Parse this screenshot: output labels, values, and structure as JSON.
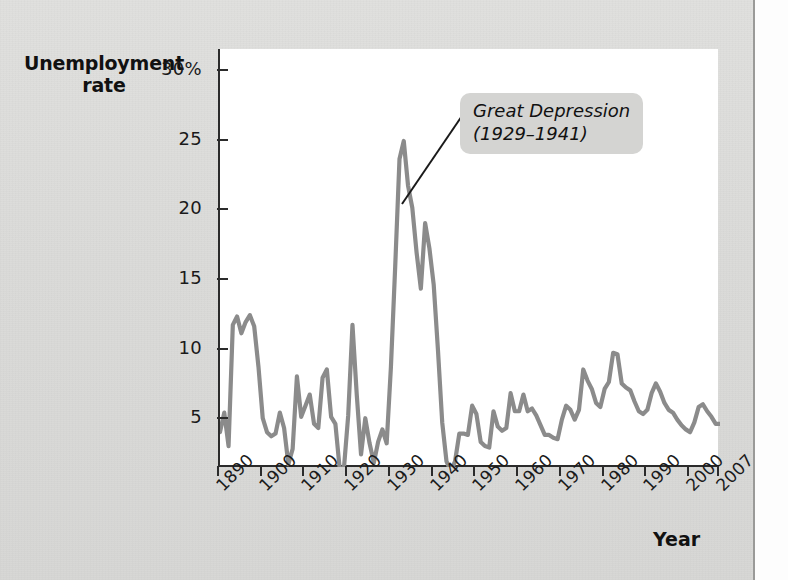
{
  "figure": {
    "y_axis_title": "Unemployment\nrate",
    "x_axis_title": "Year",
    "annotation": {
      "line1": "Great Depression",
      "line2": "(1929–1941)"
    }
  },
  "colors": {
    "background": "#dcdcda",
    "plot_background": "#ffffff",
    "axis": "#2b2b2b",
    "line": "#8b8b8b",
    "annotation_box": "#d4d4d2",
    "text": "#111111"
  },
  "chart_data": {
    "type": "line",
    "title": "",
    "subtitle": "",
    "xlabel": "Year",
    "ylabel": "Unemployment rate",
    "xlim": [
      1890,
      2007
    ],
    "ylim": [
      1.5,
      31.5
    ],
    "grid": false,
    "legend": null,
    "ytick_labels": [
      "30%",
      "25",
      "20",
      "15",
      "10",
      "5"
    ],
    "ytick_values": [
      30,
      25,
      20,
      15,
      10,
      5
    ],
    "xtick_labels": [
      "1890",
      "1900",
      "1910",
      "1920",
      "1930",
      "1940",
      "1950",
      "1960",
      "1970",
      "1980",
      "1990",
      "2000",
      "2007"
    ],
    "xtick_values": [
      1890,
      1900,
      1910,
      1920,
      1930,
      1940,
      1950,
      1960,
      1970,
      1980,
      1990,
      2000,
      2007
    ],
    "annotations": [
      {
        "text": "Great Depression (1929–1941)",
        "points_to_year": 1933,
        "points_to_value": 24.9
      }
    ],
    "series": [
      {
        "name": "Unemployment rate",
        "color": "#8b8b8b",
        "x": [
          1890,
          1891,
          1892,
          1893,
          1894,
          1895,
          1896,
          1897,
          1898,
          1899,
          1900,
          1901,
          1902,
          1903,
          1904,
          1905,
          1906,
          1907,
          1908,
          1909,
          1910,
          1911,
          1912,
          1913,
          1914,
          1915,
          1916,
          1917,
          1918,
          1919,
          1920,
          1921,
          1922,
          1923,
          1924,
          1925,
          1926,
          1927,
          1928,
          1929,
          1930,
          1931,
          1932,
          1933,
          1934,
          1935,
          1936,
          1937,
          1938,
          1939,
          1940,
          1941,
          1942,
          1943,
          1944,
          1945,
          1946,
          1947,
          1948,
          1949,
          1950,
          1951,
          1952,
          1953,
          1954,
          1955,
          1956,
          1957,
          1958,
          1959,
          1960,
          1961,
          1962,
          1963,
          1964,
          1965,
          1966,
          1967,
          1968,
          1969,
          1970,
          1971,
          1972,
          1973,
          1974,
          1975,
          1976,
          1977,
          1978,
          1979,
          1980,
          1981,
          1982,
          1983,
          1984,
          1985,
          1986,
          1987,
          1988,
          1989,
          1990,
          1991,
          1992,
          1993,
          1994,
          1995,
          1996,
          1997,
          1998,
          1999,
          2000,
          2001,
          2002,
          2003,
          2004,
          2005,
          2006,
          2007
        ],
        "values": [
          4.0,
          5.4,
          3.0,
          11.7,
          12.3,
          11.1,
          11.9,
          12.4,
          11.6,
          8.7,
          5.0,
          4.0,
          3.7,
          3.9,
          5.4,
          4.3,
          1.7,
          2.8,
          8.0,
          5.1,
          5.9,
          6.7,
          4.6,
          4.3,
          7.9,
          8.5,
          5.1,
          4.6,
          1.4,
          1.4,
          5.2,
          11.7,
          6.7,
          2.4,
          5.0,
          3.2,
          1.8,
          3.3,
          4.2,
          3.2,
          8.7,
          15.9,
          23.6,
          24.9,
          21.7,
          20.1,
          16.9,
          14.3,
          19.0,
          17.2,
          14.6,
          9.9,
          4.7,
          1.9,
          1.2,
          1.9,
          3.9,
          3.9,
          3.8,
          5.9,
          5.3,
          3.3,
          3.0,
          2.9,
          5.5,
          4.4,
          4.1,
          4.3,
          6.8,
          5.5,
          5.5,
          6.7,
          5.5,
          5.7,
          5.2,
          4.5,
          3.8,
          3.8,
          3.6,
          3.5,
          4.9,
          5.9,
          5.6,
          4.9,
          5.6,
          8.5,
          7.7,
          7.1,
          6.1,
          5.8,
          7.1,
          7.6,
          9.7,
          9.6,
          7.5,
          7.2,
          7.0,
          6.2,
          5.5,
          5.3,
          5.6,
          6.8,
          7.5,
          6.9,
          6.1,
          5.6,
          5.4,
          4.9,
          4.5,
          4.2,
          4.0,
          4.7,
          5.8,
          6.0,
          5.5,
          5.1,
          4.6,
          4.6
        ]
      }
    ]
  }
}
